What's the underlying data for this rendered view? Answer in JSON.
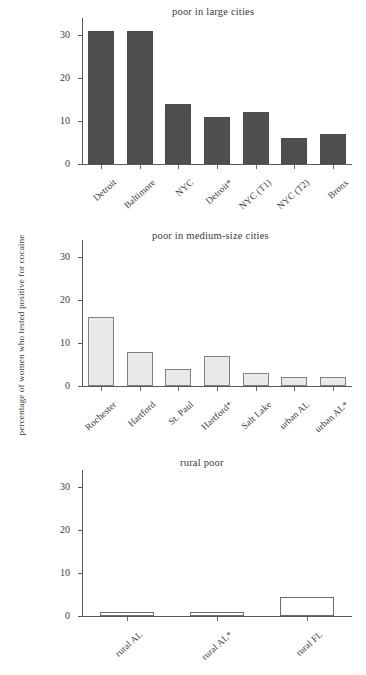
{
  "figure": {
    "ylabel": "percentage of women who tested positive for cocaine",
    "background": "#ffffff"
  },
  "chart_data": [
    {
      "type": "bar",
      "title": "poor in large cities",
      "categories": [
        "Detroit",
        "Baltimore",
        "NYC",
        "Detroit*",
        "NYC (T1)",
        "NYC (T2)",
        "Bronx"
      ],
      "values": [
        31,
        31,
        14,
        11,
        12,
        6,
        7
      ],
      "xlabel": "",
      "ylabel": "percentage of women who tested positive for cocaine",
      "ylim": [
        0,
        34
      ],
      "yticks": [
        0,
        10,
        20,
        30
      ],
      "ytick_labels": [
        "0",
        "10",
        "20",
        "30"
      ],
      "grid": false,
      "legend": false,
      "bar_color": "#4f4f4f",
      "bar_edge_color": "#4a4a4a"
    },
    {
      "type": "bar",
      "title": "poor in medium-size cities",
      "categories": [
        "Rochester",
        "Hartford",
        "St. Paul",
        "Hartford*",
        "Salt Lake",
        "urban AL",
        "urban AL*"
      ],
      "values": [
        16,
        8,
        4,
        7,
        3,
        2,
        2
      ],
      "xlabel": "",
      "ylabel": "percentage of women who tested positive for cocaine",
      "ylim": [
        0,
        34
      ],
      "yticks": [
        0,
        10,
        20,
        30
      ],
      "ytick_labels": [
        "0",
        "10",
        "20",
        "30"
      ],
      "grid": false,
      "legend": false,
      "bar_color": "#e9e9e9",
      "bar_edge_color": "#808080"
    },
    {
      "type": "bar",
      "title": "rural poor",
      "categories": [
        "rural AL",
        "rural AL*",
        "rural FL"
      ],
      "values": [
        1,
        1,
        4.5
      ],
      "xlabel": "",
      "ylabel": "percentage of women who tested positive for cocaine",
      "ylim": [
        0,
        34
      ],
      "yticks": [
        0,
        10,
        20,
        30
      ],
      "ytick_labels": [
        "0",
        "10",
        "20",
        "30"
      ],
      "grid": false,
      "legend": false,
      "bar_color": "#ffffff",
      "bar_edge_color": "#6e6e6e"
    }
  ]
}
